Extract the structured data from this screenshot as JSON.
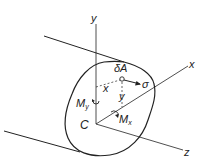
{
  "diagram": {
    "axes": {
      "y": "y",
      "x": "x",
      "z": "z"
    },
    "centroid": "C",
    "element_area": "δA",
    "stress": "σ",
    "dist_x": "x",
    "dist_y": "y",
    "moment_y": {
      "main": "M",
      "sub": "y"
    },
    "moment_x": {
      "main": "M",
      "sub": "x"
    },
    "colors": {
      "line": "#222222",
      "background": "#ffffff"
    }
  }
}
